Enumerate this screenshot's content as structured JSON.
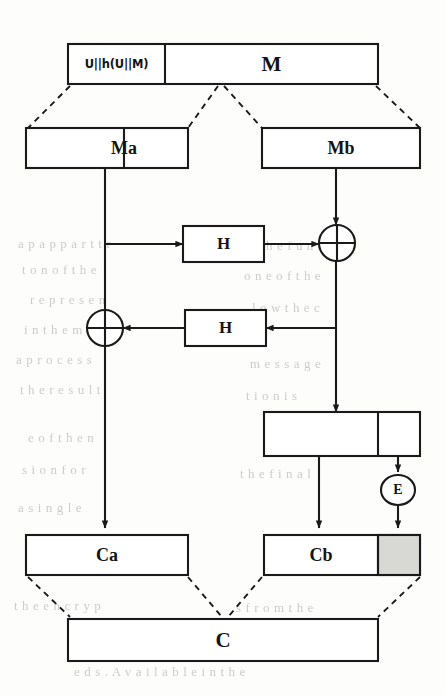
{
  "diagram": {
    "colors": {
      "stroke": "#1a1a1a",
      "background": "#fdfdfc",
      "shaded_fill": "#d8d8d4",
      "bleed_text": "#cfcdc8"
    },
    "nodes": {
      "authenticator": {
        "label": "U||h(U||M)"
      },
      "message": {
        "label": "M"
      },
      "block_ma": {
        "label": "Ma"
      },
      "block_mb": {
        "label": "Mb"
      },
      "hash_top": {
        "label": "H"
      },
      "hash_bottom": {
        "label": "H"
      },
      "xor_right": {
        "label": "+"
      },
      "xor_left": {
        "label": "+"
      },
      "intermediate": {
        "label": ""
      },
      "encrypt": {
        "label": "E"
      },
      "cipher_ca": {
        "label": "Ca"
      },
      "cipher_cb": {
        "label": "Cb"
      },
      "cipher_tail": {
        "label": ""
      },
      "cipher_c": {
        "label": "C"
      }
    },
    "bleed_through": [
      {
        "text": "a p a p p a r t t r",
        "x": 18,
        "y": 236
      },
      {
        "text": "t o n  o f  t h e",
        "x": 22,
        "y": 262
      },
      {
        "text": "r  e p  r e s e n",
        "x": 30,
        "y": 292
      },
      {
        "text": "i n  t  h e  m o",
        "x": 24,
        "y": 322
      },
      {
        "text": "a   p r o c e s s",
        "x": 16,
        "y": 352
      },
      {
        "text": "t h e   r e s u l t",
        "x": 20,
        "y": 382
      },
      {
        "text": "e  o f   t h e  n",
        "x": 28,
        "y": 430
      },
      {
        "text": "s  i o n   f o r",
        "x": 22,
        "y": 462
      },
      {
        "text": "a   s  i  n  g  l  e",
        "x": 18,
        "y": 500
      },
      {
        "text": "t h e   e n c r y p",
        "x": 14,
        "y": 598
      },
      {
        "text": "( x  +  w ( v + r ) )  i n  t h e  c a s",
        "x": 88,
        "y": 628
      },
      {
        "text": "e d s .   A v a i l a b l e   i n   t h e",
        "x": 74,
        "y": 664
      },
      {
        "text": "b y   t h e   f u n c",
        "x": 236,
        "y": 238
      },
      {
        "text": "o n e   o f   t h e",
        "x": 244,
        "y": 268
      },
      {
        "text": "l  o w   t h e   c",
        "x": 252,
        "y": 300
      },
      {
        "text": "m e s s a g e",
        "x": 250,
        "y": 356
      },
      {
        "text": "t i o n   i s",
        "x": 246,
        "y": 388
      },
      {
        "text": "t h e   f i n a l",
        "x": 240,
        "y": 466
      },
      {
        "text": "s   f r o m   t h e",
        "x": 236,
        "y": 600
      }
    ]
  }
}
